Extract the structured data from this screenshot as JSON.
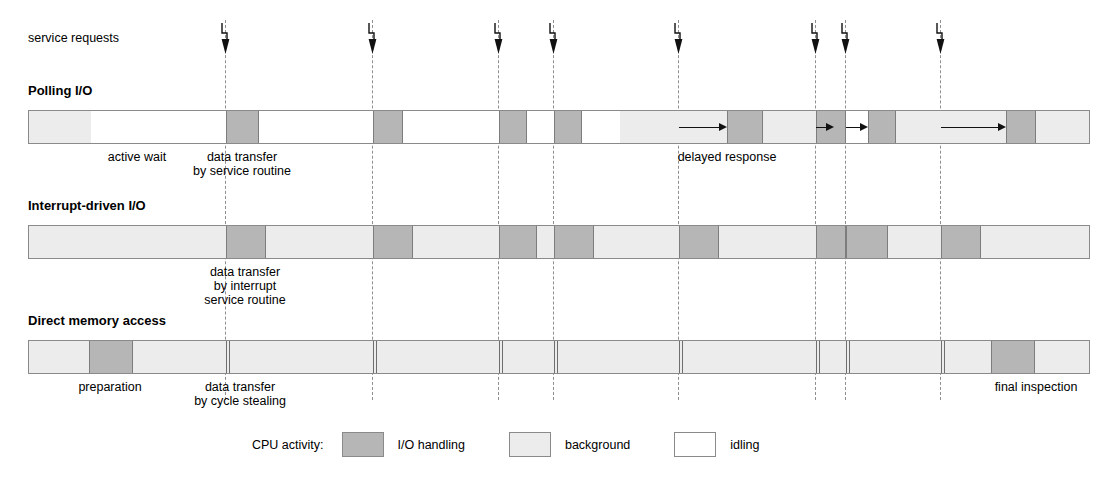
{
  "figure": {
    "requests_label": "service requests"
  },
  "colors": {
    "io_handling": "#b6b6b6",
    "background": "#ececec",
    "idling": "#ffffff",
    "bar_border": "#8a8a8a",
    "guide_line": "#8f8f8f",
    "arrow": "#111111"
  },
  "service_requests": {
    "label": "service requests",
    "marker_icon": "lightning-bolt-arrow-icon",
    "positions": [
      225,
      372,
      498,
      553,
      678,
      815,
      845,
      940
    ]
  },
  "rows": [
    {
      "id": "polling",
      "title": "Polling I/O",
      "bar": {
        "x": 28,
        "y": 110,
        "width": 1062,
        "height": 34
      },
      "segments": [
        {
          "type": "background",
          "x": 28,
          "w": 62
        },
        {
          "type": "idling",
          "x": 90,
          "w": 135
        },
        {
          "type": "io",
          "x": 225,
          "w": 33
        },
        {
          "type": "idling",
          "x": 258,
          "w": 114
        },
        {
          "type": "io",
          "x": 372,
          "w": 30
        },
        {
          "type": "idling",
          "x": 402,
          "w": 96
        },
        {
          "type": "io",
          "x": 498,
          "w": 28
        },
        {
          "type": "idling",
          "x": 526,
          "w": 27
        },
        {
          "type": "io",
          "x": 553,
          "w": 28
        },
        {
          "type": "idling",
          "x": 581,
          "w": 38
        },
        {
          "type": "background",
          "x": 619,
          "w": 107
        },
        {
          "type": "io",
          "x": 726,
          "w": 36
        },
        {
          "type": "background",
          "x": 762,
          "w": 53
        },
        {
          "type": "io",
          "x": 815,
          "w": 30
        },
        {
          "type": "idling",
          "x": 845,
          "w": 22
        },
        {
          "type": "io",
          "x": 867,
          "w": 28
        },
        {
          "type": "background",
          "x": 895,
          "w": 110
        },
        {
          "type": "io",
          "x": 1005,
          "w": 30
        },
        {
          "type": "background",
          "x": 1035,
          "w": 55
        }
      ],
      "delay_arrows": [
        {
          "x": 678,
          "w": 48
        },
        {
          "x": 815,
          "w": 18
        },
        {
          "x": 845,
          "w": 22
        },
        {
          "x": 940,
          "w": 65
        }
      ],
      "annotations": [
        {
          "text": "active wait",
          "x": 137,
          "y": 150,
          "align": "center"
        },
        {
          "text": "data transfer",
          "x": 242,
          "y": 150,
          "align": "center"
        },
        {
          "text": "by service routine",
          "x": 242,
          "y": 164,
          "align": "center"
        },
        {
          "text": "delayed response",
          "x": 727,
          "y": 150,
          "align": "center"
        }
      ]
    },
    {
      "id": "interrupt",
      "title": "Interrupt-driven I/O",
      "bar": {
        "x": 28,
        "y": 225,
        "width": 1062,
        "height": 34
      },
      "segments": [
        {
          "type": "background",
          "x": 28,
          "w": 197
        },
        {
          "type": "io",
          "x": 225,
          "w": 40
        },
        {
          "type": "background",
          "x": 265,
          "w": 107
        },
        {
          "type": "io",
          "x": 372,
          "w": 40
        },
        {
          "type": "background",
          "x": 412,
          "w": 86
        },
        {
          "type": "io",
          "x": 498,
          "w": 38
        },
        {
          "type": "background",
          "x": 536,
          "w": 17
        },
        {
          "type": "io",
          "x": 553,
          "w": 40
        },
        {
          "type": "background",
          "x": 593,
          "w": 85
        },
        {
          "type": "io",
          "x": 678,
          "w": 40
        },
        {
          "type": "background",
          "x": 718,
          "w": 97
        },
        {
          "type": "io",
          "x": 815,
          "w": 30
        },
        {
          "type": "io",
          "x": 845,
          "w": 42
        },
        {
          "type": "background",
          "x": 887,
          "w": 53
        },
        {
          "type": "io",
          "x": 940,
          "w": 40
        },
        {
          "type": "background",
          "x": 980,
          "w": 110
        }
      ],
      "annotations": [
        {
          "text": "data transfer",
          "x": 245,
          "y": 265,
          "align": "center"
        },
        {
          "text": "by interrupt",
          "x": 245,
          "y": 279,
          "align": "center"
        },
        {
          "text": "service routine",
          "x": 245,
          "y": 293,
          "align": "center"
        }
      ]
    },
    {
      "id": "dma",
      "title": "Direct memory access",
      "bar": {
        "x": 28,
        "y": 340,
        "width": 1062,
        "height": 34
      },
      "segments": [
        {
          "type": "background",
          "x": 28,
          "w": 1062
        },
        {
          "type": "io",
          "x": 88,
          "w": 44
        }
      ],
      "cycle_steal_ticks": [
        225,
        228,
        372,
        375,
        498,
        501,
        553,
        556,
        678,
        681,
        815,
        818,
        845,
        848,
        940,
        943
      ],
      "dma_final_block": {
        "x": 990,
        "w": 44
      },
      "annotations": [
        {
          "text": "preparation",
          "x": 110,
          "y": 380,
          "align": "center"
        },
        {
          "text": "data transfer",
          "x": 240,
          "y": 380,
          "align": "center"
        },
        {
          "text": "by cycle stealing",
          "x": 240,
          "y": 394,
          "align": "center"
        },
        {
          "text": "final inspection",
          "x": 1036,
          "y": 380,
          "align": "center"
        }
      ]
    }
  ],
  "legend": {
    "title": "CPU activity:",
    "items": [
      {
        "swatch": "io",
        "label": "I/O handling"
      },
      {
        "swatch": "bg",
        "label": "background"
      },
      {
        "swatch": "idle",
        "label": "idling"
      }
    ]
  }
}
